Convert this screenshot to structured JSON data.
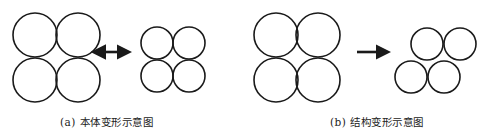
{
  "colors": {
    "stroke": "#1a1a1a",
    "background": "#ffffff",
    "caption": "#222222"
  },
  "panels": [
    {
      "id": "a",
      "caption": "(a)  本体变形示意图",
      "arrow": "double-arrow",
      "before": {
        "radius": 22,
        "circles": [
          [
            35,
            35
          ],
          [
            78,
            35
          ],
          [
            35,
            80
          ],
          [
            78,
            80
          ]
        ]
      },
      "after": {
        "radius": 16,
        "circles": [
          [
            157,
            43
          ],
          [
            189,
            43
          ],
          [
            157,
            76
          ],
          [
            189,
            76
          ]
        ]
      },
      "arrow_geom": {
        "x1": 101,
        "x2": 127,
        "y": 52
      }
    },
    {
      "id": "b",
      "caption": "(b)  结构变形示意图",
      "arrow": "right-arrow",
      "before": {
        "radius": 22,
        "circles": [
          [
            276,
            35
          ],
          [
            318,
            35
          ],
          [
            276,
            80
          ],
          [
            318,
            80
          ]
        ]
      },
      "after": {
        "radius": 16,
        "circles": [
          [
            427,
            44
          ],
          [
            460,
            44
          ],
          [
            411,
            77
          ],
          [
            444,
            77
          ]
        ]
      },
      "arrow_geom": {
        "x1": 357,
        "x2": 386,
        "y": 52
      }
    }
  ]
}
